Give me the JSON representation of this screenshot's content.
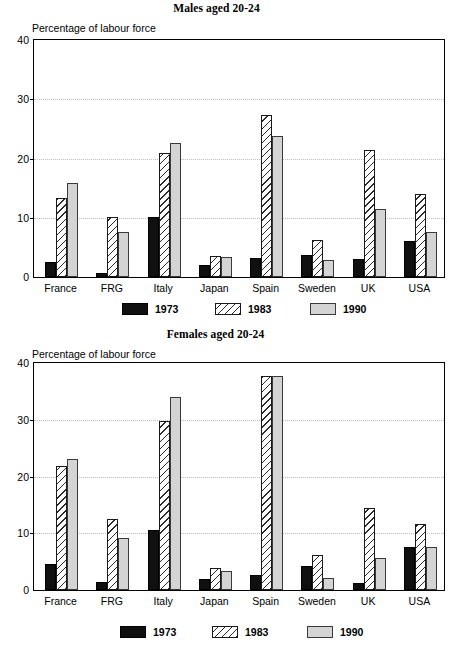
{
  "figure": {
    "axis_caption": "Percentage of labour force",
    "legend": [
      {
        "key": "1973",
        "label": "1973",
        "swatch": "solid-black"
      },
      {
        "key": "1983",
        "label": "1983",
        "swatch": "diagonal-hatch"
      },
      {
        "key": "1990",
        "label": "1990",
        "swatch": "light-grey"
      }
    ],
    "colors": {
      "series_1973": "#101010",
      "series_1983": "#ffffff",
      "series_1990": "#d4d4d4",
      "axis": "#000000",
      "gridline": "#bdbdbd"
    }
  },
  "chart_data": [
    {
      "id": "males",
      "type": "bar",
      "title": "Males aged 20-24",
      "xlabel": "",
      "ylabel": "Percentage of labour force",
      "ylim": [
        0,
        40
      ],
      "yticks": [
        0,
        10,
        20,
        30,
        40
      ],
      "ytick_labels": [
        "0",
        "10",
        "20",
        "30",
        "40"
      ],
      "grid": true,
      "legend_position": "bottom",
      "categories": [
        "France",
        "FRG",
        "Italy",
        "Japan",
        "Spain",
        "Sweden",
        "UK",
        "USA"
      ],
      "series": [
        {
          "name": "1973",
          "values": [
            2.5,
            0.7,
            10.2,
            2.0,
            3.2,
            3.8,
            3.1,
            6.0
          ]
        },
        {
          "name": "1983",
          "values": [
            13.4,
            10.2,
            21.0,
            3.5,
            27.4,
            6.3,
            21.4,
            14.0
          ]
        },
        {
          "name": "1990",
          "values": [
            15.9,
            7.6,
            22.7,
            3.4,
            23.8,
            2.8,
            11.4,
            7.6
          ]
        }
      ]
    },
    {
      "id": "females",
      "type": "bar",
      "title": "Females aged 20-24",
      "xlabel": "",
      "ylabel": "Percentage of labour force",
      "ylim": [
        0,
        40
      ],
      "yticks": [
        0,
        10,
        20,
        30,
        40
      ],
      "ytick_labels": [
        "0",
        "10",
        "20",
        "30",
        "40"
      ],
      "grid": true,
      "legend_position": "bottom",
      "categories": [
        "France",
        "FRG",
        "Italy",
        "Japan",
        "Spain",
        "Sweden",
        "UK",
        "USA"
      ],
      "series": [
        {
          "name": "1973",
          "values": [
            4.6,
            1.5,
            10.5,
            2.0,
            2.7,
            4.2,
            1.2,
            7.5
          ]
        },
        {
          "name": "1983",
          "values": [
            21.8,
            12.6,
            29.8,
            3.9,
            37.8,
            6.2,
            14.4,
            11.7
          ]
        },
        {
          "name": "1990",
          "values": [
            23.1,
            9.2,
            34.0,
            3.3,
            37.7,
            2.1,
            5.7,
            7.5
          ]
        }
      ]
    }
  ]
}
